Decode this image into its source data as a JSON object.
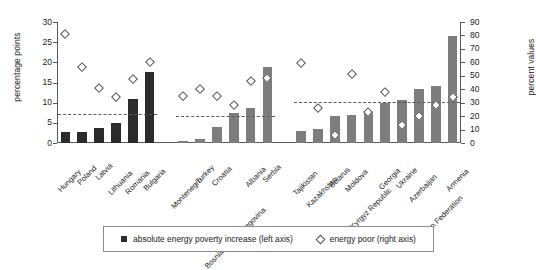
{
  "chart_data": {
    "type": "bar",
    "title": "",
    "xlabel": "",
    "ylabel": "percentage points",
    "y2label": "percent values",
    "ylim": [
      0,
      30
    ],
    "y2lim": [
      0,
      90
    ],
    "yticks": [
      0,
      5,
      10,
      15,
      20,
      25,
      30
    ],
    "y2ticks": [
      0,
      10,
      20,
      30,
      40,
      50,
      60,
      70,
      80,
      90
    ],
    "grid": false,
    "legend_position": "bottom",
    "categories": [
      "Hungary",
      "Poland",
      "Latvia",
      "Lithuania",
      "Romania",
      "Bulgaria",
      "Montenegro",
      "Turkey",
      "Croatia",
      "Bosnia and Herzegovina",
      "Albania",
      "Serbia",
      "Tajikistan",
      "Kazakhstan",
      "Belarus",
      "Moldova",
      "Kyrgyz Republic",
      "Georgia",
      "Ukraine",
      "Azerbaijan",
      "Russian Federation",
      "Armenia"
    ],
    "series": [
      {
        "name": "absolute energy poverty increase (left axis)",
        "axis": "left",
        "unit": "percentage points",
        "marker": "square",
        "values": [
          2.8,
          2.7,
          3.6,
          5.0,
          11.0,
          17.6,
          0.4,
          0.9,
          3.9,
          7.5,
          8.8,
          18.8,
          3.0,
          3.4,
          6.8,
          6.9,
          7.6,
          9.9,
          10.6,
          13.3,
          14.2,
          26.5
        ]
      },
      {
        "name": "energy poor (right axis)",
        "axis": "right",
        "unit": "percent",
        "marker": "diamond",
        "values": [
          81,
          56,
          41,
          34,
          47,
          60,
          35,
          40,
          35,
          28,
          46,
          48,
          59,
          26,
          6,
          51,
          23,
          38,
          13,
          20,
          28,
          34
        ]
      }
    ],
    "groups": [
      {
        "name": "EU members",
        "start": 0,
        "end": 5,
        "mean_left": 7.2
      },
      {
        "name": "South East Europe",
        "start": 6,
        "end": 11,
        "mean_left": 6.7
      },
      {
        "name": "CIS",
        "start": 12,
        "end": 21,
        "mean_left": 10.2
      }
    ],
    "reference_lines": {
      "label": "group average (dashed)",
      "values": [
        7.2,
        6.7,
        10.2
      ]
    },
    "colors": {
      "bar_dark": "#2b2b2b",
      "bar_light": "#7d7d7d",
      "marker_outline": "#4d4d4d",
      "axis": "#58595b",
      "dashed": "#5a5a5a",
      "background": "#ffffff"
    }
  },
  "legend": {
    "items": [
      {
        "label": "absolute energy poverty increase (left axis)",
        "marker": "square"
      },
      {
        "label": "energy poor (right axis)",
        "marker": "diamond"
      }
    ]
  }
}
